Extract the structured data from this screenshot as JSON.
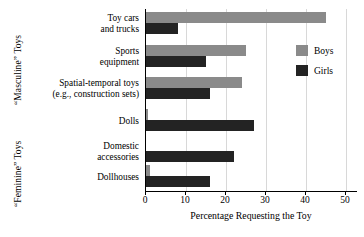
{
  "chart_data": {
    "type": "bar",
    "orientation": "horizontal",
    "title": "",
    "xlabel": "Percentage Requesting the Toy",
    "ylabel": "",
    "xlim": [
      0,
      53
    ],
    "xticks": [
      0,
      10,
      20,
      30,
      40,
      50
    ],
    "xtick_labels": [
      "0",
      "10",
      "20",
      "30",
      "40",
      "50"
    ],
    "grid": true,
    "grid_axis": "x",
    "legend_position": "right",
    "categories": [
      "Toy cars and trucks",
      "Sports equipment",
      "Spatial-temporal toys (e.g., construction sets)",
      "Dolls",
      "Domestic accessories",
      "Dollhouses"
    ],
    "series": [
      {
        "name": "Boys",
        "color": "#8a8a8a",
        "values": [
          45,
          25,
          24,
          0.5,
          0,
          1
        ]
      },
      {
        "name": "Girls",
        "color": "#232323",
        "values": [
          8,
          15,
          16,
          27,
          22,
          16
        ]
      }
    ]
  },
  "axis_groups": [
    {
      "label": "“Masculine” Toys"
    },
    {
      "label": "“Feminine” Toys"
    }
  ],
  "category_labels": [
    {
      "lines": [
        "Toy cars",
        "and trucks"
      ]
    },
    {
      "lines": [
        "Sports",
        "equipment"
      ]
    },
    {
      "lines": [
        "Spatial-temporal toys",
        "(e.g., construction sets)"
      ]
    },
    {
      "lines": [
        "Dolls"
      ]
    },
    {
      "lines": [
        "Domestic",
        "accessories"
      ]
    },
    {
      "lines": [
        "Dollhouses"
      ]
    }
  ],
  "legend": {
    "entries": [
      {
        "label": "Boys",
        "color": "#8a8a8a"
      },
      {
        "label": "Girls",
        "color": "#232323"
      }
    ]
  },
  "axis": {
    "x_title": "Percentage Requesting the Toy",
    "tick_labels": [
      "0",
      "10",
      "20",
      "30",
      "40",
      "50"
    ]
  }
}
